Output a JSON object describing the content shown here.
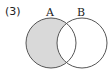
{
  "problem_number": "(3)",
  "diagram": {
    "type": "venn",
    "sets": [
      {
        "label": "A",
        "cx": 51,
        "cy": 43,
        "r": 25
      },
      {
        "label": "B",
        "cx": 82,
        "cy": 43,
        "r": 25
      }
    ],
    "shaded_region": "A minus B",
    "shade_color": "#d9d9d9",
    "stroke_color": "#555555"
  }
}
